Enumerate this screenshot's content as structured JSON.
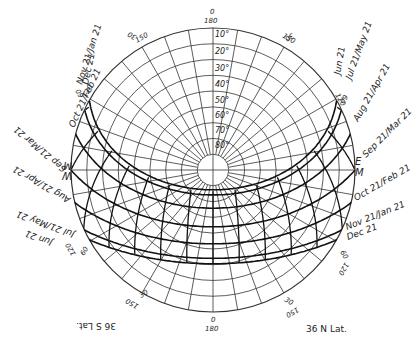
{
  "diagram": {
    "latitude_label": "36 N Lat.",
    "latitude_label_mirrored": "36 S Lat.",
    "center": {
      "x": 213,
      "y": 170
    },
    "radius": 142,
    "line_color": "#222222",
    "altitude_rings": [
      "10°",
      "20°",
      "30°",
      "40°",
      "50°",
      "60°",
      "70°",
      "80°"
    ],
    "azimuth_labels": {
      "top": {
        "outer": "0",
        "inner": "180"
      },
      "bottom": {
        "outer": "0",
        "inner": "180"
      },
      "top_left": {
        "outer": "30",
        "inner": "150"
      },
      "top_right": {
        "outer": "30",
        "inner": "150"
      },
      "left_upper": {
        "outer": "60",
        "inner": "120"
      },
      "right_upper": {
        "outer": "60",
        "inner": "120"
      },
      "bottom_left": {
        "outer": "30",
        "inner": "150"
      },
      "bottom_right": {
        "outer": "30",
        "inner": "150"
      },
      "left_lower": {
        "outer": "60",
        "inner": "120"
      },
      "right_lower": {
        "outer": "60",
        "inner": "120"
      }
    },
    "cardinal": {
      "east": "E",
      "west": "W",
      "marker": "M"
    },
    "date_labels_right": [
      "Jun 21",
      "Jul 21/May 21",
      "Aug 21/Apr 21",
      "Sep 21/Mar 21",
      "Oct 21/Feb 21",
      "Nov 21/Jan 21",
      "Dec 21"
    ],
    "date_labels_left": [
      "Dec 21",
      "Nov 21/Jan 21",
      "Oct 21/Feb 21",
      "Sep 21/Mar 21",
      "Aug 21/Apr 21",
      "Jul 21/May 21",
      "Jun 21"
    ],
    "hour_labels": [
      "5",
      "6",
      "7",
      "8",
      "9",
      "10",
      "11",
      "12",
      "1",
      "2",
      "3",
      "4",
      "5",
      "6",
      "7"
    ]
  }
}
